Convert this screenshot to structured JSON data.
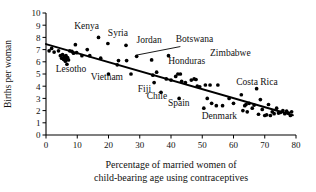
{
  "chart_data": {
    "type": "scatter",
    "title": "",
    "xlabel": "Percentage of married women of child-bearing age using contraceptives",
    "xlabel_line1": "Percentage of married women of",
    "xlabel_line2": "child-bearing age using contraceptives",
    "ylabel": "Births per woman",
    "xlim": [
      0,
      80
    ],
    "ylim": [
      0,
      10
    ],
    "xticks": [
      0,
      10,
      20,
      30,
      40,
      50,
      60,
      70,
      80
    ],
    "xtick_labels": [
      "0",
      "10",
      "20",
      "30",
      "40",
      "50",
      "60",
      "70",
      "80"
    ],
    "yticks": [
      0,
      1,
      2,
      3,
      4,
      5,
      6,
      7,
      8,
      9,
      10
    ],
    "ytick_labels": [
      "0",
      "1",
      "2",
      "3",
      "4",
      "5",
      "6",
      "7",
      "8",
      "9",
      "10"
    ],
    "grid": false,
    "legend": null,
    "marker_color": "#000000",
    "line_color": "#000000",
    "axis_color": "#000000",
    "trend_line": {
      "label": "least-squares regression line",
      "x0": 0,
      "y0": 7.45,
      "x1": 79,
      "y1": 1.62
    },
    "points": [
      {
        "x": 1.0,
        "y": 6.9
      },
      {
        "x": 1.8,
        "y": 7.1
      },
      {
        "x": 2.6,
        "y": 6.8
      },
      {
        "x": 4.0,
        "y": 6.9
      },
      {
        "x": 4.6,
        "y": 6.5
      },
      {
        "x": 5.0,
        "y": 6.3
      },
      {
        "x": 5.3,
        "y": 6.6
      },
      {
        "x": 5.6,
        "y": 6.2
      },
      {
        "x": 5.8,
        "y": 6.45
      },
      {
        "x": 6.0,
        "y": 6.3
      },
      {
        "x": 6.2,
        "y": 6.05
      },
      {
        "x": 6.4,
        "y": 6.5
      },
      {
        "x": 6.5,
        "y": 6.2
      },
      {
        "x": 6.7,
        "y": 5.8
      },
      {
        "x": 6.9,
        "y": 6.35
      },
      {
        "x": 7.2,
        "y": 6.15
      },
      {
        "x": 7.6,
        "y": 6.9
      },
      {
        "x": 8.3,
        "y": 6.85
      },
      {
        "x": 8.8,
        "y": 6.7
      },
      {
        "x": 9.4,
        "y": 7.4
      },
      {
        "x": 9.8,
        "y": 6.75
      },
      {
        "x": 11.5,
        "y": 6.5
      },
      {
        "x": 13.2,
        "y": 7.0
      },
      {
        "x": 14.0,
        "y": 6.5
      },
      {
        "x": 16.8,
        "y": 8.0
      },
      {
        "x": 17.5,
        "y": 6.3
      },
      {
        "x": 19.8,
        "y": 7.5
      },
      {
        "x": 20.0,
        "y": 5.0
      },
      {
        "x": 22.8,
        "y": 5.75
      },
      {
        "x": 23.2,
        "y": 6.1
      },
      {
        "x": 25.6,
        "y": 7.35
      },
      {
        "x": 25.8,
        "y": 6.1
      },
      {
        "x": 27.2,
        "y": 5.0
      },
      {
        "x": 29.0,
        "y": 6.45
      },
      {
        "x": 33.8,
        "y": 6.15
      },
      {
        "x": 34.2,
        "y": 4.9
      },
      {
        "x": 34.6,
        "y": 4.3
      },
      {
        "x": 35.4,
        "y": 5.15
      },
      {
        "x": 36.8,
        "y": 3.5
      },
      {
        "x": 38.5,
        "y": 4.6
      },
      {
        "x": 39.2,
        "y": 6.5
      },
      {
        "x": 40.0,
        "y": 4.5
      },
      {
        "x": 41.5,
        "y": 4.8
      },
      {
        "x": 42.2,
        "y": 5.0
      },
      {
        "x": 42.6,
        "y": 3.0
      },
      {
        "x": 43.0,
        "y": 5.0
      },
      {
        "x": 43.4,
        "y": 4.4
      },
      {
        "x": 44.6,
        "y": 4.3
      },
      {
        "x": 46.5,
        "y": 4.5
      },
      {
        "x": 47.4,
        "y": 4.6
      },
      {
        "x": 48.0,
        "y": 4.55
      },
      {
        "x": 48.4,
        "y": 4.0
      },
      {
        "x": 49.2,
        "y": 3.95
      },
      {
        "x": 50.5,
        "y": 2.2
      },
      {
        "x": 51.0,
        "y": 4.1
      },
      {
        "x": 51.6,
        "y": 3.0
      },
      {
        "x": 52.5,
        "y": 4.1
      },
      {
        "x": 53.0,
        "y": 2.6
      },
      {
        "x": 54.5,
        "y": 2.4
      },
      {
        "x": 55.0,
        "y": 4.1
      },
      {
        "x": 56.5,
        "y": 2.4
      },
      {
        "x": 58.6,
        "y": 3.0
      },
      {
        "x": 60.0,
        "y": 2.6
      },
      {
        "x": 62.5,
        "y": 3.3
      },
      {
        "x": 63.0,
        "y": 2.0
      },
      {
        "x": 63.6,
        "y": 2.4
      },
      {
        "x": 64.0,
        "y": 2.5
      },
      {
        "x": 64.4,
        "y": 1.9
      },
      {
        "x": 65.0,
        "y": 2.6
      },
      {
        "x": 66.0,
        "y": 2.2
      },
      {
        "x": 66.6,
        "y": 2.45
      },
      {
        "x": 67.4,
        "y": 3.8
      },
      {
        "x": 68.0,
        "y": 1.7
      },
      {
        "x": 68.6,
        "y": 2.9
      },
      {
        "x": 69.2,
        "y": 2.1
      },
      {
        "x": 70.0,
        "y": 1.6
      },
      {
        "x": 70.6,
        "y": 1.65
      },
      {
        "x": 71.2,
        "y": 2.5
      },
      {
        "x": 71.8,
        "y": 1.6
      },
      {
        "x": 72.4,
        "y": 1.9
      },
      {
        "x": 73.0,
        "y": 1.75
      },
      {
        "x": 73.8,
        "y": 2.2
      },
      {
        "x": 74.4,
        "y": 1.8
      },
      {
        "x": 75.0,
        "y": 1.85
      },
      {
        "x": 75.8,
        "y": 2.0
      },
      {
        "x": 76.4,
        "y": 1.75
      },
      {
        "x": 77.0,
        "y": 1.95
      },
      {
        "x": 77.6,
        "y": 1.8
      },
      {
        "x": 78.2,
        "y": 1.6
      },
      {
        "x": 78.6,
        "y": 1.9
      }
    ],
    "annotations": [
      {
        "text": "Kenya",
        "x": 13.0,
        "y": 8.7,
        "anchor": "middle"
      },
      {
        "text": "Syria",
        "x": 23.0,
        "y": 8.1,
        "anchor": "middle"
      },
      {
        "text": "Jordan",
        "x": 33.0,
        "y": 7.55,
        "anchor": "middle"
      },
      {
        "text": "Botswana",
        "x": 47.5,
        "y": 7.6,
        "anchor": "middle"
      },
      {
        "text": "Zimbabwe",
        "x": 52.5,
        "y": 6.5,
        "anchor": "start"
      },
      {
        "text": "Honduras",
        "x": 45.0,
        "y": 5.85,
        "anchor": "middle"
      },
      {
        "text": "Lesotho",
        "x": 8.0,
        "y": 5.15,
        "anchor": "middle"
      },
      {
        "text": "Vietnam",
        "x": 19.5,
        "y": 4.5,
        "anchor": "middle"
      },
      {
        "text": "Fiji",
        "x": 31.5,
        "y": 3.55,
        "anchor": "middle"
      },
      {
        "text": "Chile",
        "x": 35.5,
        "y": 2.95,
        "anchor": "middle"
      },
      {
        "text": "Spain",
        "x": 42.5,
        "y": 2.4,
        "anchor": "middle"
      },
      {
        "text": "Denmark",
        "x": 55.5,
        "y": 1.3,
        "anchor": "middle"
      },
      {
        "text": "Costa Rica",
        "x": 67.5,
        "y": 4.1,
        "anchor": "middle"
      }
    ],
    "leader_lines": [
      {
        "from_x": 43.0,
        "from_y": 7.25,
        "to_x": 29.0,
        "to_y": 6.55
      }
    ]
  }
}
